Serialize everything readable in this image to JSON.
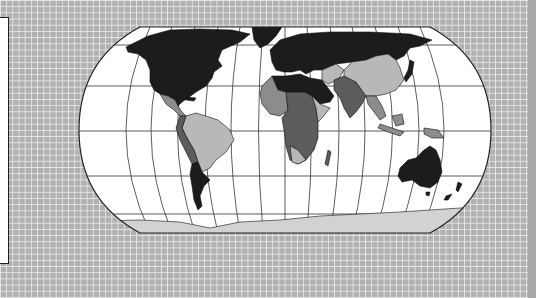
{
  "map": {
    "projection": "robinson-like",
    "colors": {
      "ocean": "#ffffff",
      "outline": "#222222",
      "graticule": "#333333",
      "shade_black": "#1c1c1c",
      "shade_dark": "#5c5c5c",
      "shade_medium": "#8c8c8c",
      "shade_light": "#b8b8b8",
      "antarctica": "#d2d2d2",
      "background": "#b1b1b1",
      "background_grid": "#e6e6e6"
    },
    "regions": [
      {
        "name": "north-america",
        "shade": "black"
      },
      {
        "name": "greenland",
        "shade": "black"
      },
      {
        "name": "europe-russia",
        "shade": "black"
      },
      {
        "name": "north-africa-middle-east",
        "shade": "black"
      },
      {
        "name": "china",
        "shade": "light"
      },
      {
        "name": "south-asia",
        "shade": "dark"
      },
      {
        "name": "southeast-asia",
        "shade": "medium"
      },
      {
        "name": "central-america",
        "shade": "medium"
      },
      {
        "name": "south-america-north",
        "shade": "light"
      },
      {
        "name": "south-america-west",
        "shade": "dark"
      },
      {
        "name": "southern-cone",
        "shade": "black"
      },
      {
        "name": "sub-saharan-africa",
        "shade": "dark"
      },
      {
        "name": "west-africa",
        "shade": "medium"
      },
      {
        "name": "east-africa",
        "shade": "light"
      },
      {
        "name": "madagascar",
        "shade": "dark"
      },
      {
        "name": "australia",
        "shade": "black"
      },
      {
        "name": "new-zealand",
        "shade": "black"
      },
      {
        "name": "japan",
        "shade": "black"
      },
      {
        "name": "indonesia",
        "shade": "medium"
      },
      {
        "name": "antarctica",
        "shade": "antarctica"
      }
    ]
  },
  "side_panel": {
    "content": ""
  }
}
